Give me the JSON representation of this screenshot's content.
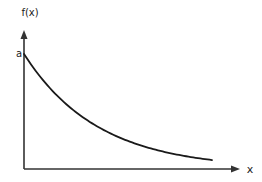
{
  "chart_data": {
    "type": "line",
    "title": "",
    "xlabel": "x",
    "ylabel": "f(x)",
    "function": "exponential decay f(x) = a·e^(-kx)",
    "y_intercept_label": "a",
    "k": 2.55,
    "xlim": [
      0,
      1.15
    ],
    "ylim": [
      0,
      1.2
    ],
    "x_range_plotted": [
      0,
      1
    ],
    "series": [
      {
        "name": "f(x)",
        "x": [
          0,
          0.1,
          0.2,
          0.3,
          0.4,
          0.5,
          0.6,
          0.7,
          0.8,
          0.9,
          1.0
        ],
        "y": [
          1.0,
          0.775,
          0.6,
          0.465,
          0.361,
          0.279,
          0.217,
          0.168,
          0.13,
          0.101,
          0.078
        ]
      }
    ],
    "grid": false,
    "legend": "none",
    "colors": {
      "axis": "#333333",
      "curve": "#1a1a1a"
    }
  }
}
